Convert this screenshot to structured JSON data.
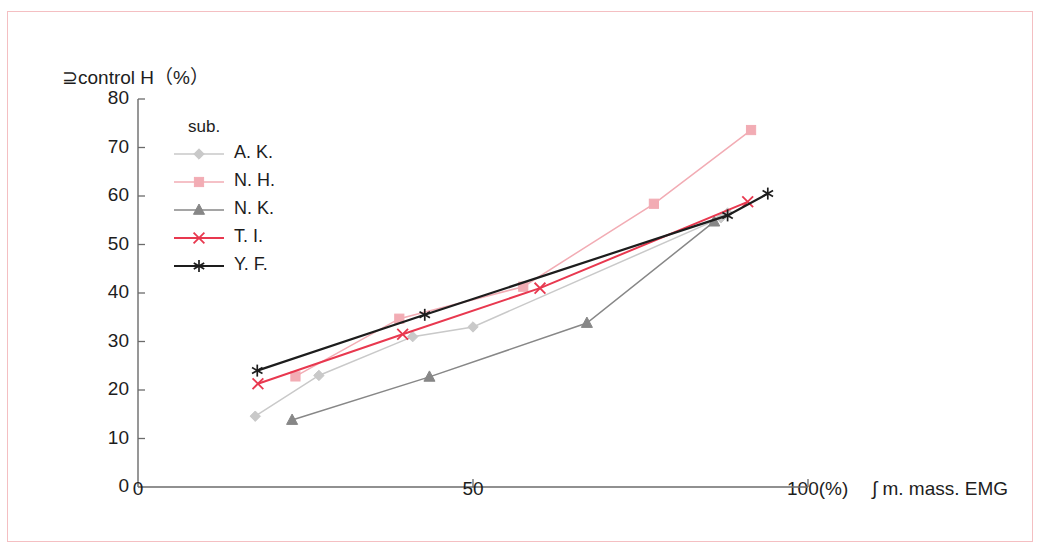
{
  "figure": {
    "border_color": "#f4bfc2",
    "background": "#ffffff"
  },
  "axes": {
    "y_title": "⊇control H（%）",
    "y_title_text": "⎺control H (%)",
    "x_unit_label": "100(%)",
    "x_title": "∫ m. mass. EMG",
    "x_tick_labels": [
      "0",
      "50"
    ],
    "y_tick_labels": [
      "80",
      "70",
      "60",
      "50",
      "40",
      "30",
      "20",
      "10",
      "0"
    ]
  },
  "legend": {
    "title": "sub.",
    "entries": [
      {
        "label": "A. K.",
        "color": "#c9c9c9",
        "marker": "diamond"
      },
      {
        "label": "N. H.",
        "color": "#f2acb4",
        "marker": "square"
      },
      {
        "label": "N. K.",
        "color": "#878787",
        "marker": "triangle"
      },
      {
        "label": "T. I.",
        "color": "#e8384f",
        "marker": "x"
      },
      {
        "label": "Y. F.",
        "color": "#1d1d1d",
        "marker": "asterisk"
      }
    ]
  },
  "chart_data": {
    "type": "line",
    "title": "",
    "xlabel": "∫ m. mass. EMG (%)",
    "ylabel": "⎺control H (%)",
    "xlim": [
      0,
      100
    ],
    "ylim": [
      0,
      80
    ],
    "xticks": [
      0,
      50,
      100
    ],
    "yticks": [
      0,
      10,
      20,
      30,
      40,
      50,
      60,
      70,
      80
    ],
    "grid": false,
    "legend_position": "upper-left-inside",
    "series": [
      {
        "name": "A. K.",
        "color": "#c9c9c9",
        "marker": "diamond",
        "points": [
          [
            17.5,
            14.6
          ],
          [
            27.0,
            23.0
          ],
          [
            41.0,
            31.0
          ],
          [
            50.0,
            33.0
          ],
          [
            87.0,
            55.5
          ],
          [
            88.0,
            56.5
          ]
        ],
        "x": [
          17.5,
          27.0,
          41.0,
          50.0,
          87.0,
          88.0
        ],
        "y": [
          14.6,
          23.0,
          31.0,
          33.0,
          55.5,
          56.5
        ]
      },
      {
        "name": "N. H.",
        "color": "#f2acb4",
        "marker": "square",
        "points": [
          [
            23.5,
            22.8
          ],
          [
            39.0,
            34.7
          ],
          [
            57.5,
            41.3
          ],
          [
            77.0,
            58.4
          ],
          [
            91.5,
            73.6
          ]
        ],
        "x": [
          23.5,
          39.0,
          57.5,
          77.0,
          91.5
        ],
        "y": [
          22.8,
          34.7,
          41.3,
          58.4,
          73.6
        ]
      },
      {
        "name": "N. K.",
        "color": "#878787",
        "marker": "triangle",
        "points": [
          [
            23.0,
            13.8
          ],
          [
            43.5,
            22.7
          ],
          [
            67.0,
            33.8
          ],
          [
            86.0,
            54.7
          ]
        ],
        "x": [
          23.0,
          43.5,
          67.0,
          86.0
        ],
        "y": [
          13.8,
          22.7,
          33.8,
          54.7
        ]
      },
      {
        "name": "T. I.",
        "color": "#e8384f",
        "marker": "x",
        "points": [
          [
            17.9,
            21.3
          ],
          [
            39.5,
            31.5
          ],
          [
            60.0,
            41.0
          ],
          [
            91.0,
            58.8
          ]
        ],
        "x": [
          17.9,
          39.5,
          60.0,
          91.0
        ],
        "y": [
          21.3,
          31.5,
          41.0,
          58.8
        ]
      },
      {
        "name": "Y. F.",
        "color": "#1d1d1d",
        "marker": "asterisk",
        "points": [
          [
            17.8,
            24.0
          ],
          [
            42.8,
            35.5
          ],
          [
            88.0,
            56.0
          ],
          [
            94.0,
            60.5
          ]
        ],
        "x": [
          17.8,
          42.8,
          88.0,
          94.0
        ],
        "y": [
          24.0,
          35.5,
          56.0,
          60.5
        ]
      }
    ]
  }
}
